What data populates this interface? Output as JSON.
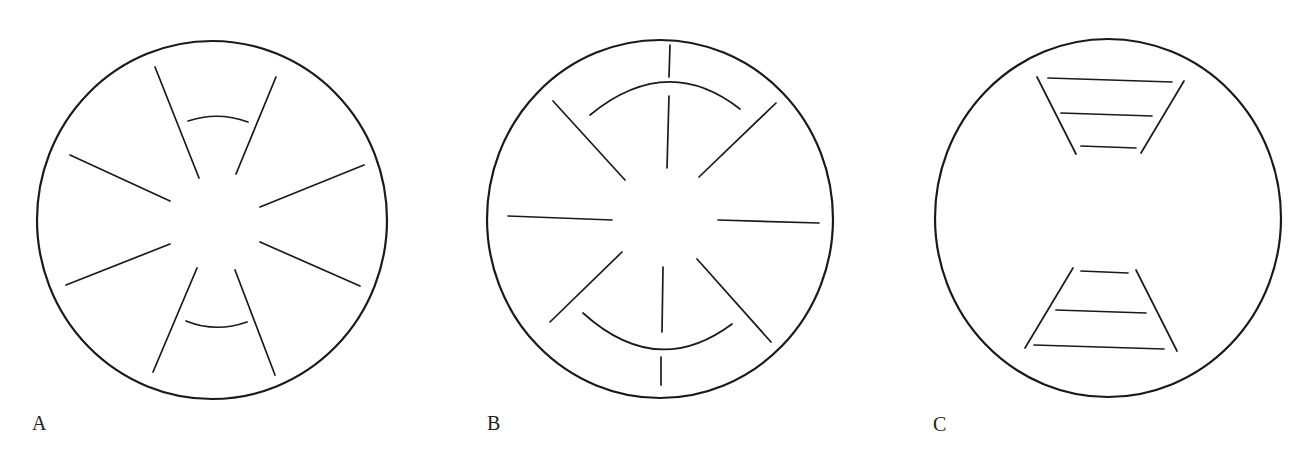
{
  "figure": {
    "colors": {
      "stroke": "#1a1a1a",
      "background": "#ffffff",
      "label": "#222222"
    },
    "panels": [
      {
        "id": "A",
        "label": "A",
        "description": "Circle with eight radial line segments around a clear center; short arcs between the top pair and between the bottom pair of radials"
      },
      {
        "id": "B",
        "label": "B",
        "description": "Circle with eight radial segments around a clear center plus short vertical ticks at top and bottom; larger concentric arcs above and below the center"
      },
      {
        "id": "C",
        "label": "C",
        "description": "Circle containing two trapezoid ladder-like shapes: one at top narrowing downward and one at bottom widening downward, each with three horizontal rungs"
      }
    ]
  }
}
